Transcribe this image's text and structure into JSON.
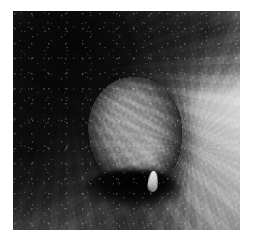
{
  "page": {
    "background_color": "#ffffff",
    "width_px": 254,
    "height_px": 244
  },
  "photo": {
    "alt_text": "Grayscale clinical close-up photograph of a rounded nodular skin mass",
    "type": "grayscale-photograph",
    "color_mode": "grayscale",
    "frame": {
      "left_px": 13,
      "top_px": 11,
      "width_px": 227,
      "height_px": 219,
      "border": "none",
      "margin_color": "#ffffff"
    },
    "regions": [
      {
        "name": "dark-hair-bearing-surround",
        "description": "Very dark, coarsely textured skin occupying the upper-left, left and lower-left of the frame",
        "approx_gray_hex": "#1a1a1a"
      },
      {
        "name": "central-nodular-mass",
        "description": "Smooth rounded ovoid mass occupying the centre of the frame, mid-gray with a bright specular sheen on its lower-right aspect",
        "approx_gray_hex": "#8e8e8e"
      },
      {
        "name": "inferior-shadow-crescent",
        "description": "Deep black crescent shadow beneath the mass",
        "approx_gray_hex": "#060606"
      },
      {
        "name": "bright-apical-tip",
        "description": "Small bright pale protrusion at the inferior pole of the mass",
        "approx_gray_hex": "#e8e8e8"
      },
      {
        "name": "right-lighter-skin",
        "description": "Lighter, smoother skin field along the right margin of the frame",
        "approx_gray_hex": "#a8a8a8"
      }
    ],
    "tone_range": {
      "darkest_hex": "#000000",
      "lightest_hex": "#f2f2f2",
      "midtone_hex": "#6f6f6f"
    }
  },
  "overlays": {
    "labels": [],
    "scale_bar": null,
    "annotations": [],
    "caption": ""
  }
}
